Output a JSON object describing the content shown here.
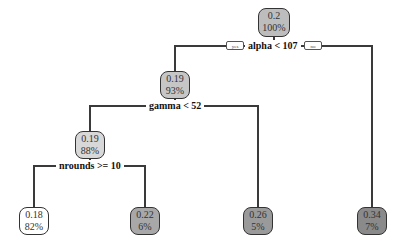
{
  "tree": {
    "branch_labels": {
      "yes": "yes",
      "no": "no"
    },
    "nodes": [
      {
        "id": "root",
        "value": "0.2",
        "percent": "100%",
        "fill": "#bdbdbd"
      },
      {
        "id": "n2",
        "value": "0.19",
        "percent": "93%",
        "fill": "#c6c6c6"
      },
      {
        "id": "n4",
        "value": "0.19",
        "percent": "88%",
        "fill": "#d8d8d8"
      },
      {
        "id": "leaf1",
        "value": "0.18",
        "percent": "82%",
        "fill": "#ffffff"
      },
      {
        "id": "leaf2",
        "value": "0.22",
        "percent": "6%",
        "fill": "#a8a8a8"
      },
      {
        "id": "leaf3",
        "value": "0.26",
        "percent": "5%",
        "fill": "#9a9a9a"
      },
      {
        "id": "leaf4",
        "value": "0.34",
        "percent": "7%",
        "fill": "#8a8a8a"
      }
    ],
    "splits": [
      {
        "id": "s1",
        "label": "alpha < 107"
      },
      {
        "id": "s2",
        "label": "gamma < 52"
      },
      {
        "id": "s3",
        "label": "nrounds >= 10"
      }
    ]
  }
}
